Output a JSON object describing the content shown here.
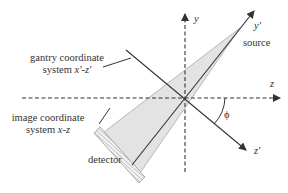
{
  "diagram": {
    "labels": {
      "gantry_line1": "gantry coordinate",
      "gantry_line2_prefix": "system ",
      "gantry_line2_axes": "x'-z'",
      "image_line1": "image coordinate",
      "image_line2_prefix": "system ",
      "image_line2_axes": "x-z",
      "detector": "detector",
      "source": "source",
      "axis_y": "y",
      "axis_y_prime": "y'",
      "axis_z": "z",
      "axis_z_prime": "z'",
      "angle": "ϕ"
    },
    "colors": {
      "line": "#333333",
      "fan_fill": "#e3e3e3",
      "fan_stroke": "#999999",
      "background": "#ffffff"
    }
  }
}
